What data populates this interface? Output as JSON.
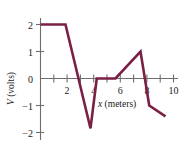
{
  "chart_data": {
    "type": "line",
    "title": "",
    "subtitle": "",
    "xlabel": "x (meters)",
    "ylabel": "V (volts)",
    "xlim": [
      0,
      11.0
    ],
    "ylim": [
      -2.5,
      2.4
    ],
    "grid": false,
    "legend": null,
    "line_color": "#7a2046",
    "axis_color": "#6e6e6e",
    "x_ticks": [
      1,
      2,
      3,
      4,
      5,
      6,
      7,
      8,
      9,
      10
    ],
    "x_tick_labels": [
      "",
      "2",
      "",
      "4",
      "",
      "6",
      "",
      "8",
      "",
      "10"
    ],
    "y_ticks": [
      -2,
      -1,
      0,
      1,
      2
    ],
    "y_tick_labels": [
      "−2",
      "−1",
      "0",
      "1",
      "2"
    ],
    "series": [
      {
        "name": "V(x)",
        "x": [
          0,
          2,
          4,
          4.5,
          6,
          8,
          8.7,
          10
        ],
        "values": [
          2,
          2,
          -1.85,
          0,
          0,
          1,
          -1.0,
          -1.4
        ]
      }
    ],
    "annotations": []
  },
  "labels": {
    "x_axis_title": "x (meters)",
    "x_axis_title_symbol": "x",
    "x_axis_title_unit": " (meters)",
    "y_axis_title": "V (volts)",
    "y_axis_title_symbol": "V",
    "y_axis_title_unit": " (volts)",
    "y_2": "2",
    "y_1": "1",
    "y_0": "0",
    "y_m1": "−1",
    "y_m2": "−2",
    "x_2": "2",
    "x_4": "4",
    "x_6": "6",
    "x_8": "8",
    "x_10": "10"
  }
}
